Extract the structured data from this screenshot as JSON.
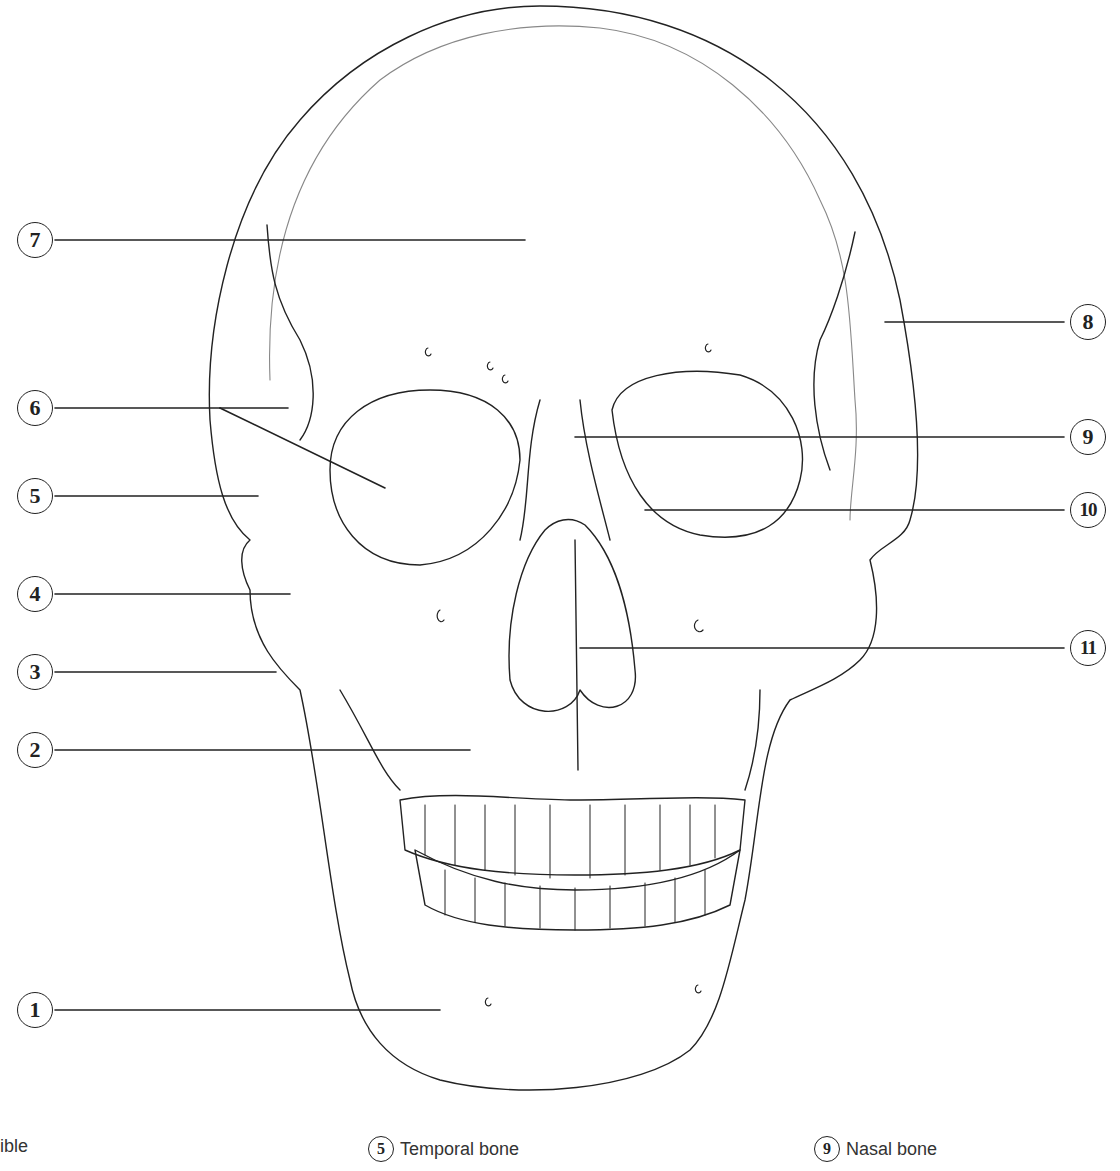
{
  "diagram": {
    "labels_left": [
      {
        "num": "7",
        "y": 240
      },
      {
        "num": "6",
        "y": 408
      },
      {
        "num": "5",
        "y": 496
      },
      {
        "num": "4",
        "y": 594
      },
      {
        "num": "3",
        "y": 672
      },
      {
        "num": "2",
        "y": 750
      },
      {
        "num": "1",
        "y": 1010
      }
    ],
    "labels_right": [
      {
        "num": "8",
        "y": 322
      },
      {
        "num": "9",
        "y": 437
      },
      {
        "num": "10",
        "y": 510
      },
      {
        "num": "11",
        "y": 648
      }
    ]
  },
  "legend": {
    "items": [
      {
        "num": "",
        "label": "ible"
      },
      {
        "num": "5",
        "label": "Temporal bone"
      },
      {
        "num": "9",
        "label": "Nasal bone"
      }
    ]
  }
}
